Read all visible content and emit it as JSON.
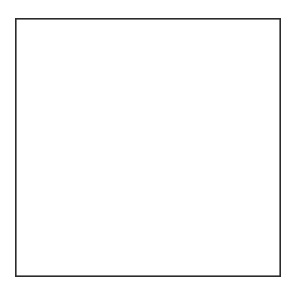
{
  "figure": {
    "title": "Pavement / soil cross-section",
    "kind": "engineering-cross-section-drawing",
    "background_color": "#ffffff",
    "line_color": "#1c1c1c",
    "frame": {
      "name": "outer-border",
      "x": 15,
      "y": 18,
      "width": 266,
      "height": 259,
      "stroke": "#2b2b2b",
      "stroke_width": 1.6,
      "fill": "#ffffff"
    },
    "void_region": {
      "label": "open-space-above-pavement",
      "fill": "#ffffff",
      "top": 18,
      "bottom": 138
    },
    "layers": [
      {
        "id": "layer-surface-course",
        "label": "Surface course",
        "order": 1,
        "hatch": {
          "pattern": "diagonal-up-right",
          "spacing": 3.2,
          "angle": 45,
          "color": "#2a2a2a",
          "stroke_width": 0.75
        },
        "fill": "#f4f4f4",
        "top_y_left": 138,
        "top_y_right": 134,
        "bottom_y_left": 173,
        "bottom_y_right": 170,
        "notched_edge": true,
        "notch_count": 13,
        "notch_depth": 5,
        "blocks": 3
      },
      {
        "id": "layer-base-course",
        "label": "Base course",
        "order": 2,
        "hatch": {
          "pattern": "diagonal-up-right",
          "spacing": 3.4,
          "angle": 45,
          "color": "#2f2f2f",
          "stroke_width": 0.75
        },
        "fill": "#f6f6f6",
        "top_y_left": 178,
        "top_y_right": 175,
        "bottom_y_left": 211,
        "bottom_y_right": 209,
        "wavy_top_boundary": true,
        "aggregate_particles": 11
      },
      {
        "id": "layer-subgrade",
        "label": "Subgrade",
        "order": 3,
        "hatch": {
          "pattern": "diagonal-up-right",
          "spacing": 6.5,
          "angle": 45,
          "color": "#8e8e8e",
          "stroke_width": 0.7
        },
        "fill": "#fbfbfb",
        "top_y_left": 211,
        "top_y_right": 209,
        "bottom_y": 277
      }
    ],
    "vertical_joints": [
      {
        "name": "joint-left",
        "x": 130,
        "y_top": 136,
        "y_bottom": 178,
        "style": "irregular-crack"
      },
      {
        "name": "joint-right",
        "x": 247,
        "y_top": 135,
        "y_bottom": 174,
        "style": "irregular-crack"
      },
      {
        "name": "crack-base-course",
        "x": 196,
        "y_top": 180,
        "y_bottom": 211,
        "style": "straight-crack"
      }
    ],
    "boundaries": [
      {
        "name": "surface-top-edge",
        "type": "near-straight-sloped"
      },
      {
        "name": "surface-notched-underline",
        "type": "castellated"
      },
      {
        "name": "base-wavy-interface",
        "type": "irregular-wavy-with-aggregate"
      },
      {
        "name": "subgrade-interface",
        "type": "slightly-irregular"
      }
    ]
  }
}
